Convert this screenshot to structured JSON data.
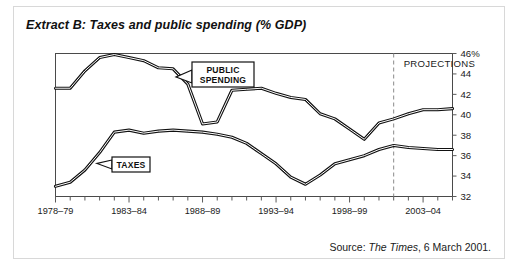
{
  "figure": {
    "title": "Extract B: Taxes and public spending (% GDP)",
    "source_prefix": "Source: ",
    "source_publication": "The Times",
    "source_suffix": ", 6 March 2001."
  },
  "chart_data": {
    "type": "line",
    "title": "Extract B: Taxes and public spending (% GDP)",
    "xlabel": "",
    "ylabel": "% GDP",
    "ylim": [
      32,
      46
    ],
    "yticks": [
      32,
      34,
      36,
      38,
      40,
      42,
      44,
      46
    ],
    "ytick_labels": [
      "32",
      "34",
      "36",
      "38",
      "40",
      "42",
      "44",
      "46%"
    ],
    "grid": false,
    "legend_position": "inline-callouts",
    "x": [
      "1978-79",
      "1979-80",
      "1980-81",
      "1981-82",
      "1982-83",
      "1983-84",
      "1984-85",
      "1985-86",
      "1986-87",
      "1987-88",
      "1988-89",
      "1989-90",
      "1990-91",
      "1991-92",
      "1992-93",
      "1993-94",
      "1994-95",
      "1995-96",
      "1996-97",
      "1997-98",
      "1998-99",
      "1999-00",
      "2000-01",
      "2001-02",
      "2002-03",
      "2003-04",
      "2004-05",
      "2005-06"
    ],
    "xtick_labels": [
      "1978-79",
      "1983-84",
      "1988-89",
      "1993-94",
      "1998-99",
      "2003-04"
    ],
    "xtick_indices": [
      0,
      5,
      10,
      15,
      20,
      25
    ],
    "series": [
      {
        "name": "PUBLIC SPENDING",
        "values": [
          42.6,
          42.6,
          44.3,
          45.6,
          45.9,
          45.6,
          45.3,
          44.6,
          44.5,
          43.0,
          39.1,
          39.3,
          42.4,
          42.5,
          42.6,
          42.1,
          41.7,
          41.5,
          40.1,
          39.6,
          38.6,
          37.6,
          39.2,
          39.6,
          40.1,
          40.5,
          40.5,
          40.6
        ],
        "color": "#111111"
      },
      {
        "name": "TAXES",
        "values": [
          33.0,
          33.4,
          34.6,
          36.3,
          38.3,
          38.5,
          38.2,
          38.4,
          38.5,
          38.4,
          38.3,
          38.1,
          37.8,
          37.2,
          36.2,
          35.2,
          33.9,
          33.2,
          34.1,
          35.2,
          35.6,
          36.0,
          36.6,
          37.0,
          36.8,
          36.7,
          36.6,
          36.6
        ],
        "color": "#111111"
      }
    ],
    "annotations": [
      {
        "name": "projections-divider",
        "label": "PROJECTIONS",
        "at_x": "2001-02",
        "style": "vertical-dashed"
      },
      {
        "name": "public-spending-callout",
        "label": "PUBLIC SPENDING",
        "series": "PUBLIC SPENDING"
      },
      {
        "name": "taxes-callout",
        "label": "TAXES",
        "series": "TAXES"
      }
    ]
  }
}
